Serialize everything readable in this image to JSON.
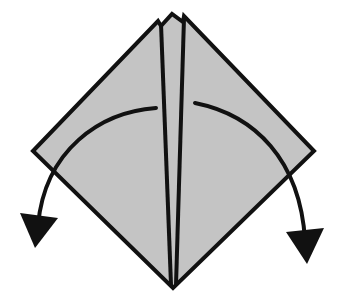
{
  "diagram": {
    "type": "origami-fold-step",
    "colors": {
      "paper": "#c4c4c4",
      "line": "#111111",
      "background": "#ffffff"
    },
    "elements": [
      {
        "name": "diamond-paper",
        "kind": "shape"
      },
      {
        "name": "left-center-flap",
        "kind": "crease"
      },
      {
        "name": "right-center-flap",
        "kind": "crease"
      },
      {
        "name": "left-fold-arrow",
        "kind": "arrow",
        "direction": "down-left"
      },
      {
        "name": "right-fold-arrow",
        "kind": "arrow",
        "direction": "down-right"
      }
    ]
  }
}
